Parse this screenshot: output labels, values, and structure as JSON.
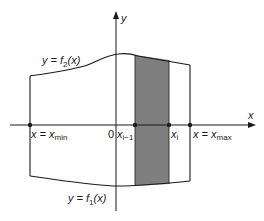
{
  "diagram": {
    "type": "region-between-curves",
    "colors": {
      "line": "#1a1a1a",
      "strip_fill": "#7f7f7f",
      "background": "#ffffff"
    },
    "axes": {
      "x_label": "x",
      "y_label": "y",
      "origin_label": "0"
    },
    "curves": {
      "upper": {
        "label_prefix": "y = f",
        "label_sub": "2",
        "label_suffix": "(x)"
      },
      "lower": {
        "label_prefix": "y = f",
        "label_sub": "1",
        "label_suffix": "(x)"
      }
    },
    "points": {
      "x_min": {
        "label_prefix": "x = x",
        "label_sub": "min"
      },
      "x_i_minus_1": {
        "label_prefix": "x",
        "label_sub": "i−1"
      },
      "x_i": {
        "label_prefix": "x",
        "label_sub": "i"
      },
      "x_max": {
        "label_prefix": "x = x",
        "label_sub": "max"
      }
    },
    "shaded_strip": {
      "from": "x_{i-1}",
      "to": "x_i"
    }
  }
}
